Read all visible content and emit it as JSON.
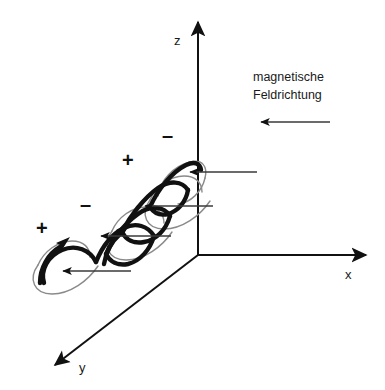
{
  "figure": {
    "background_color": "#ffffff",
    "stroke_color": "#111111",
    "secondary_stroke_color": "#7a7a7a",
    "width": 385,
    "height": 390
  },
  "axes": {
    "z_label": "z",
    "x_label": "x",
    "y_label": "y",
    "origin": {
      "x": 198,
      "y": 255
    },
    "z_tip": {
      "x": 198,
      "y": 18
    },
    "x_tip": {
      "x": 371,
      "y": 255
    },
    "y_tip": {
      "x": 50,
      "y": 369
    }
  },
  "annotation": {
    "line1": "magnetische",
    "line2": "Feldrichtung",
    "arrow_direction": "left",
    "arrow_start_x": 330,
    "arrow_end_x": 257,
    "arrow_y": 122
  },
  "charge_signs": [
    {
      "label": "+",
      "x": 36,
      "y": 218
    },
    {
      "label": "–",
      "x": 80,
      "y": 194
    },
    {
      "label": "+",
      "x": 122,
      "y": 150
    },
    {
      "label": "–",
      "x": 162,
      "y": 125
    }
  ],
  "field_arrows": [
    {
      "start_x": 257,
      "end_x": 186,
      "y": 172
    },
    {
      "start_x": 213,
      "end_x": 141,
      "y": 206
    },
    {
      "start_x": 171,
      "end_x": 97,
      "y": 236
    },
    {
      "start_x": 131,
      "end_x": 59,
      "y": 271
    }
  ],
  "helix": {
    "description": "ascending double-wound coil from lower-left to upper-right",
    "front_stroke_width": 4.2,
    "back_stroke_width": 1.3,
    "turns": 4,
    "rotation_arrows": 2
  }
}
